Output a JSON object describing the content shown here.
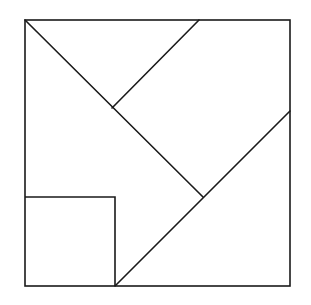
{
  "diagram": {
    "kind": "tangram",
    "stroke_color": "#1a1a1a",
    "background_color": "#ffffff",
    "pieces": [
      {
        "id": "small-square",
        "shape": "square"
      },
      {
        "id": "top-triangle",
        "shape": "triangle"
      },
      {
        "id": "upper-right-parallelogram",
        "shape": "quadrilateral"
      },
      {
        "id": "middle-left-pentagon",
        "shape": "pentagon"
      },
      {
        "id": "bottom-right-triangle",
        "shape": "triangle"
      }
    ]
  }
}
